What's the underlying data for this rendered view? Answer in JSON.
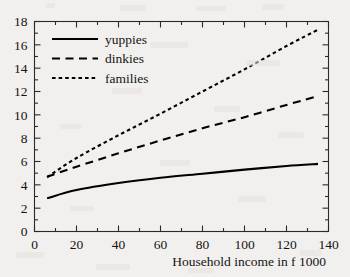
{
  "chart_data": {
    "type": "line",
    "title": "",
    "subtitle": "",
    "xlabel": "Household income in f 1000",
    "ylabel": "",
    "xlim": [
      0,
      140
    ],
    "ylim": [
      0,
      18
    ],
    "x_major_ticks": [
      0,
      20,
      40,
      60,
      80,
      100,
      120,
      140
    ],
    "x_minor_step": 10,
    "y_major_ticks": [
      0,
      2,
      4,
      6,
      8,
      10,
      12,
      14,
      16,
      18
    ],
    "y_minor_step": 1,
    "x_tick_labels": [
      "0",
      "20",
      "40",
      "60",
      "80",
      "100",
      "120",
      "140"
    ],
    "y_tick_labels": [
      "0",
      "2",
      "4",
      "6",
      "8",
      "10",
      "12",
      "14",
      "16",
      "18"
    ],
    "grid": false,
    "legend_position": "upper-left-inside",
    "tick_direction": "in",
    "x": [
      6,
      20,
      40,
      60,
      80,
      100,
      120,
      135
    ],
    "series": [
      {
        "name": "yuppies",
        "style": "solid",
        "color": "#000000",
        "values": [
          2.85,
          3.55,
          4.15,
          4.6,
          4.95,
          5.3,
          5.62,
          5.8
        ]
      },
      {
        "name": "dinkies",
        "style": "long-dash",
        "color": "#000000",
        "values": [
          4.7,
          5.55,
          6.7,
          7.8,
          8.85,
          9.8,
          10.85,
          11.6
        ]
      },
      {
        "name": "families",
        "style": "short-dash",
        "color": "#000000",
        "values": [
          4.65,
          6.3,
          8.25,
          10.1,
          12.0,
          13.9,
          15.9,
          17.3
        ]
      }
    ]
  },
  "legend": {
    "entries": [
      {
        "label": "yuppies"
      },
      {
        "label": "dinkies"
      },
      {
        "label": "families"
      }
    ]
  },
  "axes": {
    "x_title": "Household income in f 1000"
  }
}
